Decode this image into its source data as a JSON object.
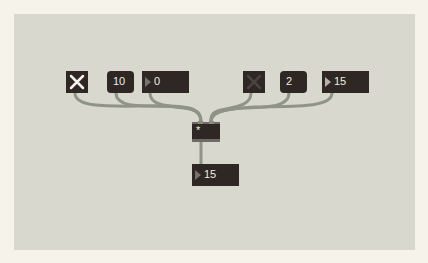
{
  "patch": {
    "objects": {
      "toggle_left": {
        "type": "toggle",
        "state": "on",
        "icon": "x-icon"
      },
      "msg_left": {
        "type": "message",
        "text": "10"
      },
      "number_left": {
        "type": "number",
        "value": "0"
      },
      "toggle_right": {
        "type": "toggle",
        "state": "off",
        "icon": "x-icon"
      },
      "msg_right": {
        "type": "message",
        "text": "2"
      },
      "number_right": {
        "type": "number",
        "value": "15"
      },
      "multiply": {
        "type": "object",
        "text": "*"
      },
      "number_out": {
        "type": "number",
        "value": "15"
      }
    },
    "colors": {
      "background": "#d9d8cf",
      "border": "#f6f4ea",
      "object": "#2e2723",
      "cable": "#8e9488",
      "text": "#f0ece6"
    }
  }
}
